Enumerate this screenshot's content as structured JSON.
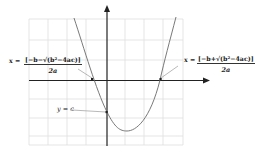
{
  "diagram": {
    "colors": {
      "grid": "#dcdcdc",
      "axis": "#222222",
      "curve": "#666666",
      "leader": "#999999"
    },
    "labels": {
      "left_root": {
        "prefix": "x =",
        "numerator": "[−b−√(b²−4ac)]",
        "denominator": "2a"
      },
      "right_root": {
        "prefix": "x =",
        "numerator": "[−b+√(b²−4ac)]",
        "denominator": "2a"
      },
      "y_intercept": "y = c"
    }
  }
}
